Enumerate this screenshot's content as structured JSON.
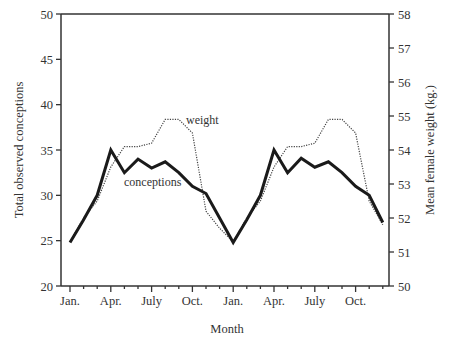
{
  "chart_data": {
    "type": "line",
    "title": "",
    "xlabel": "Month",
    "ylabel": "Total observed conceptions",
    "ylabel_right": "Mean female weight (kg.)",
    "ylim": [
      20,
      50
    ],
    "ylim_right": [
      50,
      58
    ],
    "yticks": [
      20,
      25,
      30,
      35,
      40,
      45,
      50
    ],
    "yticks_right": [
      50,
      51,
      52,
      53,
      54,
      55,
      56,
      57,
      58
    ],
    "x_tick_labels": [
      "Jan.",
      "Apr.",
      "July",
      "Oct.",
      "Jan.",
      "Apr.",
      "July",
      "Oct."
    ],
    "x": [
      "Jan",
      "Feb",
      "Mar",
      "Apr",
      "May",
      "Jun",
      "Jul",
      "Aug",
      "Sep",
      "Oct",
      "Nov",
      "Dec",
      "Jan",
      "Feb",
      "Mar",
      "Apr",
      "May",
      "Jun",
      "Jul",
      "Aug",
      "Sep",
      "Oct",
      "Nov",
      "Dec"
    ],
    "grid": false,
    "legend": "inline labels",
    "series": [
      {
        "name": "conceptions",
        "axis": "left",
        "style": "solid-thick",
        "values": [
          24.8,
          27.3,
          30.0,
          35.0,
          32.5,
          34.0,
          33.0,
          33.7,
          32.5,
          31.0,
          30.2,
          27.5,
          24.8,
          27.3,
          30.0,
          35.0,
          32.5,
          34.1,
          33.1,
          33.7,
          32.5,
          31.0,
          30.0,
          27.0
        ]
      },
      {
        "name": "weight",
        "axis": "right",
        "style": "dotted-thin",
        "values": [
          51.3,
          52.0,
          52.5,
          53.5,
          54.1,
          54.1,
          54.2,
          54.9,
          54.9,
          54.5,
          52.2,
          51.7,
          51.3,
          52.0,
          52.5,
          53.5,
          54.1,
          54.1,
          54.2,
          54.9,
          54.9,
          54.5,
          52.5,
          51.8
        ]
      }
    ],
    "annotations": [
      {
        "text": "weight",
        "near": "weight series peak, first year"
      },
      {
        "text": "conceptions",
        "near": "conceptions series, first year"
      }
    ]
  },
  "labels": {
    "weight": "weight",
    "conceptions": "conceptions",
    "xlabel": "Month",
    "ylabel": "Total observed conceptions",
    "ylabel_right": "Mean female weight (kg.)"
  },
  "colors": {
    "axis": "#333333",
    "conceptions": "#1a1a1a",
    "weight": "#444444"
  }
}
